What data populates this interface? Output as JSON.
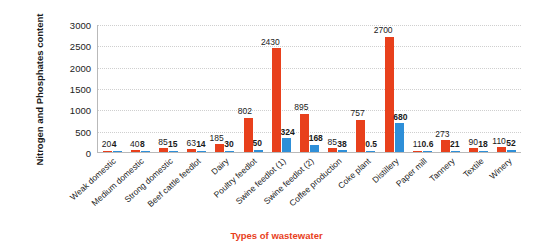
{
  "chart_data": {
    "type": "bar",
    "title": "",
    "xlabel": "Types of wastewater",
    "ylabel": "Nitrogen and Phosphates content",
    "ylim": [
      0,
      3000
    ],
    "ytick_step": 500,
    "yticks": [
      "0",
      "500",
      "1000",
      "1500",
      "2000",
      "2500",
      "3000"
    ],
    "grid": true,
    "legend": "none",
    "categories": [
      "Weak domestic",
      "Medium domestic",
      "Strong domestic",
      "Beef cattle feedlot",
      "Dairy",
      "Poultry feedlot",
      "Swine feedlot (1)",
      "Swine feedlot (2)",
      "Coffee production",
      "Coke plant",
      "Distillery",
      "Paper mill",
      "Tannery",
      "Textile",
      "Winery"
    ],
    "series": [
      {
        "name": "Nitrogen",
        "color": "#e8401c",
        "values": [
          20,
          40,
          85,
          63,
          185,
          802,
          2430,
          895,
          85,
          757,
          2700,
          11,
          273,
          90,
          110
        ],
        "labels": [
          "20",
          "40",
          "85",
          "63",
          "185",
          "802",
          "2430",
          "895",
          "85",
          "757",
          "2700",
          "11",
          "273",
          "90",
          "110"
        ]
      },
      {
        "name": "Phosphates",
        "color": "#2e8fd8",
        "values": [
          4,
          8,
          15,
          14,
          30,
          50,
          324,
          168,
          38,
          0.5,
          680,
          0.6,
          21,
          18,
          52
        ],
        "labels": [
          "4",
          "8",
          "15",
          "14",
          "30",
          "50",
          "324",
          "168",
          "38",
          "0.5",
          "680",
          "0.6",
          "21",
          "18",
          "52"
        ]
      }
    ]
  }
}
